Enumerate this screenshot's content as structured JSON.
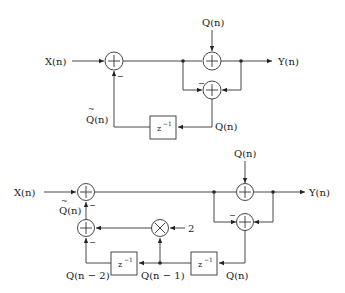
{
  "diagram1": {
    "input_label": "X(n)",
    "output_label": "Y(n)",
    "q_in_label": "Q(n)",
    "q_out_label": "Q(n)",
    "qtilde_label": "Q(n)",
    "qtilde_mark": "~",
    "delay_label": "z",
    "delay_exp": "−1",
    "minus_sign": "−",
    "minus_sign2": "−"
  },
  "diagram2": {
    "input_label": "X(n)",
    "output_label": "Y(n)",
    "q_in_label": "Q(n)",
    "q_out_label": "Q(n)",
    "qtilde_label": "Q(n)",
    "qtilde_mark": "~",
    "q_n1_label": "Q(n − 1)",
    "q_n2_label": "Q(n − 2)",
    "gain_label": "2",
    "delay1_label": "z",
    "delay1_exp": "−1",
    "delay2_label": "z",
    "delay2_exp": "−1",
    "minus_a": "−",
    "minus_b": "−",
    "minus_c": "−"
  }
}
